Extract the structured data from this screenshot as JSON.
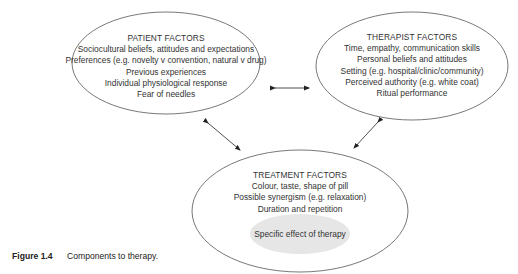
{
  "diagram": {
    "nodes": {
      "patient": {
        "title": "PATIENT FACTORS",
        "lines": [
          "Sociocultural beliefs, attitudes and expectations",
          "Preferences (e.g. novelty v convention, natural v drug)",
          "Previous experiences",
          "Individual physiological response",
          "Fear of needles"
        ]
      },
      "therapist": {
        "title": "THERAPIST FACTORS",
        "lines": [
          "Time, empathy, communication skills",
          "Personal beliefs and attitudes",
          "Setting (e.g. hospital/clinic/community)",
          "Perceived authority (e.g. white coat)",
          "Ritual performance"
        ]
      },
      "treatment": {
        "title": "TREATMENT FACTORS",
        "lines": [
          "Colour, taste, shape of pill",
          "Possible synergism (e.g. relaxation)",
          "Duration and repetition"
        ],
        "inner": "Specific effect of therapy"
      }
    },
    "edges": [
      {
        "from": "patient",
        "to": "therapist",
        "type": "bidirectional"
      },
      {
        "from": "patient",
        "to": "treatment",
        "type": "bidirectional"
      },
      {
        "from": "therapist",
        "to": "treatment",
        "type": "bidirectional"
      }
    ],
    "colors": {
      "outline": "#555555",
      "inner_fill": "#e6e6e6",
      "text": "#333333"
    }
  },
  "caption": {
    "label": "Figure 1.4",
    "text": "Components to therapy."
  }
}
